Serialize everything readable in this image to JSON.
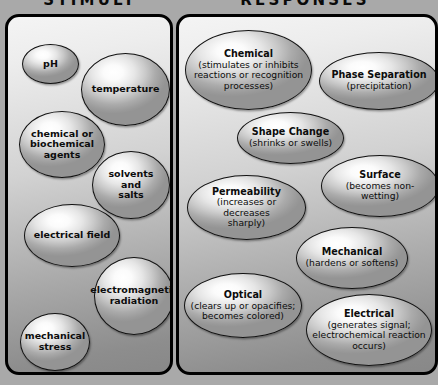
{
  "diagram": {
    "title_left": "STIMULI",
    "title_right": "RESPONSES",
    "background_color": "#a9a9a9",
    "panel_border_color": "#000000",
    "text_color": "#0c0c0c"
  },
  "stimuli": {
    "heading": "STIMULI",
    "items": [
      {
        "label": "pH",
        "x": 14,
        "y": 27,
        "w": 57,
        "h": 40
      },
      {
        "label": "temperature",
        "x": 73,
        "y": 36,
        "w": 89,
        "h": 73
      },
      {
        "label": "chemical or\nbiochemical\nagents",
        "x": 11,
        "y": 94,
        "w": 86,
        "h": 67
      },
      {
        "label": "solvents and\nsalts",
        "x": 84,
        "y": 134,
        "w": 78,
        "h": 68
      },
      {
        "label": "electrical field",
        "x": 16,
        "y": 187,
        "w": 96,
        "h": 63
      },
      {
        "label": "electromagnetic\nradiation",
        "x": 86,
        "y": 240,
        "w": 80,
        "h": 78
      },
      {
        "label": "mechanical\nstress",
        "x": 12,
        "y": 296,
        "w": 70,
        "h": 58
      }
    ]
  },
  "responses": {
    "heading": "RESPONSES",
    "items": [
      {
        "title": "Chemical",
        "detail": "(stimulates or inhibits\nreactions or recognition\nprocesses)",
        "x": 6,
        "y": 13,
        "w": 127,
        "h": 80
      },
      {
        "title": "Phase Separation",
        "detail": "(precipitation)",
        "x": 140,
        "y": 35,
        "w": 120,
        "h": 58
      },
      {
        "title": "Shape Change",
        "detail": "(shrinks or swells)",
        "x": 58,
        "y": 95,
        "w": 107,
        "h": 52
      },
      {
        "title": "Surface",
        "detail": "(becomes non-wetting)",
        "x": 142,
        "y": 138,
        "w": 118,
        "h": 62
      },
      {
        "title": "Permeability",
        "detail": "(increases or decreases\nsharply)",
        "x": 8,
        "y": 158,
        "w": 119,
        "h": 65
      },
      {
        "title": "Mechanical",
        "detail": "(hardens or softens)",
        "x": 117,
        "y": 210,
        "w": 112,
        "h": 62
      },
      {
        "title": "Optical",
        "detail": "(clears up or opacifies;\nbecomes colored)",
        "x": 5,
        "y": 256,
        "w": 118,
        "h": 65
      },
      {
        "title": "Electrical",
        "detail": "(generates signal;\nelectrochemical reaction\noccurs)",
        "x": 127,
        "y": 277,
        "w": 126,
        "h": 72
      }
    ]
  }
}
